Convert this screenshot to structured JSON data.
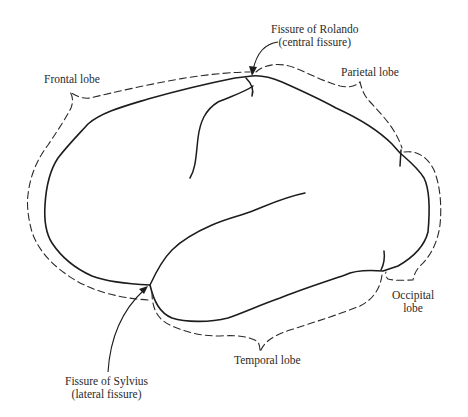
{
  "figure": {
    "stroke_color": "#1c1c1c",
    "background": "#ffffff"
  },
  "labels": {
    "rolando": {
      "line1": "Fissure of Rolando",
      "line2": "(central fissure)"
    },
    "frontal": "Frontal lobe",
    "parietal": "Parietal lobe",
    "occipital": {
      "line1": "Occipital",
      "line2": "lobe"
    },
    "temporal": "Temporal lobe",
    "sylvius": {
      "line1": "Fissure of Sylvius",
      "line2": "(lateral fissure)"
    }
  },
  "regions": [
    {
      "name": "Frontal lobe",
      "boundary": "dashed"
    },
    {
      "name": "Parietal lobe",
      "boundary": "dashed"
    },
    {
      "name": "Occipital lobe",
      "boundary": "dashed"
    },
    {
      "name": "Temporal lobe",
      "boundary": "dashed"
    }
  ],
  "fissures": [
    {
      "name": "Fissure of Rolando",
      "alias": "central fissure"
    },
    {
      "name": "Fissure of Sylvius",
      "alias": "lateral fissure"
    }
  ]
}
